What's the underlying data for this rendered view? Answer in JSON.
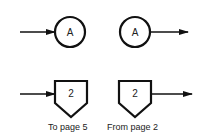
{
  "diagram": {
    "type": "flowchart-connector-symbols",
    "colors": {
      "stroke": "#111111",
      "text": "#222222",
      "background": "#ffffff"
    },
    "connectors": [
      {
        "shape": "circle",
        "label": "A",
        "arrow": "incoming",
        "kind": "on-page-connector"
      },
      {
        "shape": "circle",
        "label": "A",
        "arrow": "outgoing",
        "kind": "on-page-connector"
      },
      {
        "shape": "pentagon",
        "label": "2",
        "arrow": "incoming",
        "kind": "off-page-connector",
        "caption": "To page 5"
      },
      {
        "shape": "pentagon",
        "label": "2",
        "arrow": "outgoing",
        "kind": "off-page-connector",
        "caption": "From page 2"
      }
    ]
  }
}
